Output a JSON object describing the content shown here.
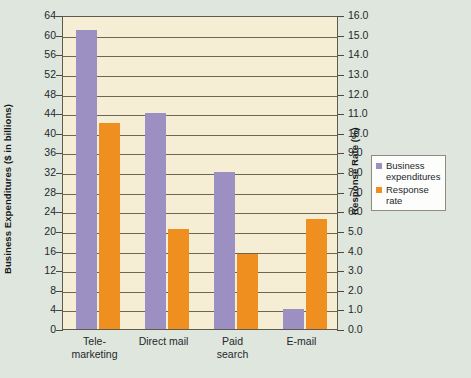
{
  "chart_data": {
    "type": "bar",
    "title": "",
    "categories": [
      "Tele-marketing",
      "Direct mail",
      "Paid search",
      "E-mail"
    ],
    "category_lines": [
      [
        "Tele-",
        "marketing"
      ],
      [
        "Direct mail"
      ],
      [
        "Paid",
        "search"
      ],
      [
        "E-mail"
      ]
    ],
    "series": [
      {
        "name": "Business expenditures",
        "axis": "left",
        "color": "#9c90c2",
        "values": [
          61,
          44,
          32,
          4
        ],
        "unit": "$ in billions"
      },
      {
        "name": "Response rate",
        "axis": "right",
        "color": "#ef8f20",
        "values": [
          10.5,
          5.1,
          3.8,
          5.6
        ],
        "unit": "%"
      }
    ],
    "left_axis": {
      "label": "Business Expenditures ($ in billions)",
      "min": 0,
      "max": 64,
      "step": 4,
      "ticks": [
        "0",
        "4",
        "8",
        "12",
        "16",
        "20",
        "24",
        "28",
        "32",
        "36",
        "40",
        "44",
        "48",
        "52",
        "56",
        "60",
        "64"
      ]
    },
    "right_axis": {
      "label": "Response Rate (%)",
      "min": 0,
      "max": 16,
      "step": 1,
      "ticks": [
        "0.0",
        "1.0",
        "2.0",
        "3.0",
        "4.0",
        "5.0",
        "6.0",
        "7.0",
        "8.0",
        "9.0",
        "10.0",
        "11.0",
        "12.0",
        "13.0",
        "14.0",
        "15.0",
        "16.0"
      ]
    },
    "xlabel": "",
    "grid": true,
    "legend_position": "right",
    "legend": [
      {
        "label_line1": "Business",
        "label_line2": "expenditures",
        "color": "#9c90c2"
      },
      {
        "label_line1": "Response",
        "label_line2": "rate",
        "color": "#ef8f20"
      }
    ]
  },
  "colors": {
    "plot_background": "#f6eed4",
    "page_background": "#dfe6de",
    "gridline": "#6d6657",
    "axis": "#5f5a4c",
    "expenditures": "#9c90c2",
    "response": "#ef8f20",
    "text": "#23282b"
  }
}
